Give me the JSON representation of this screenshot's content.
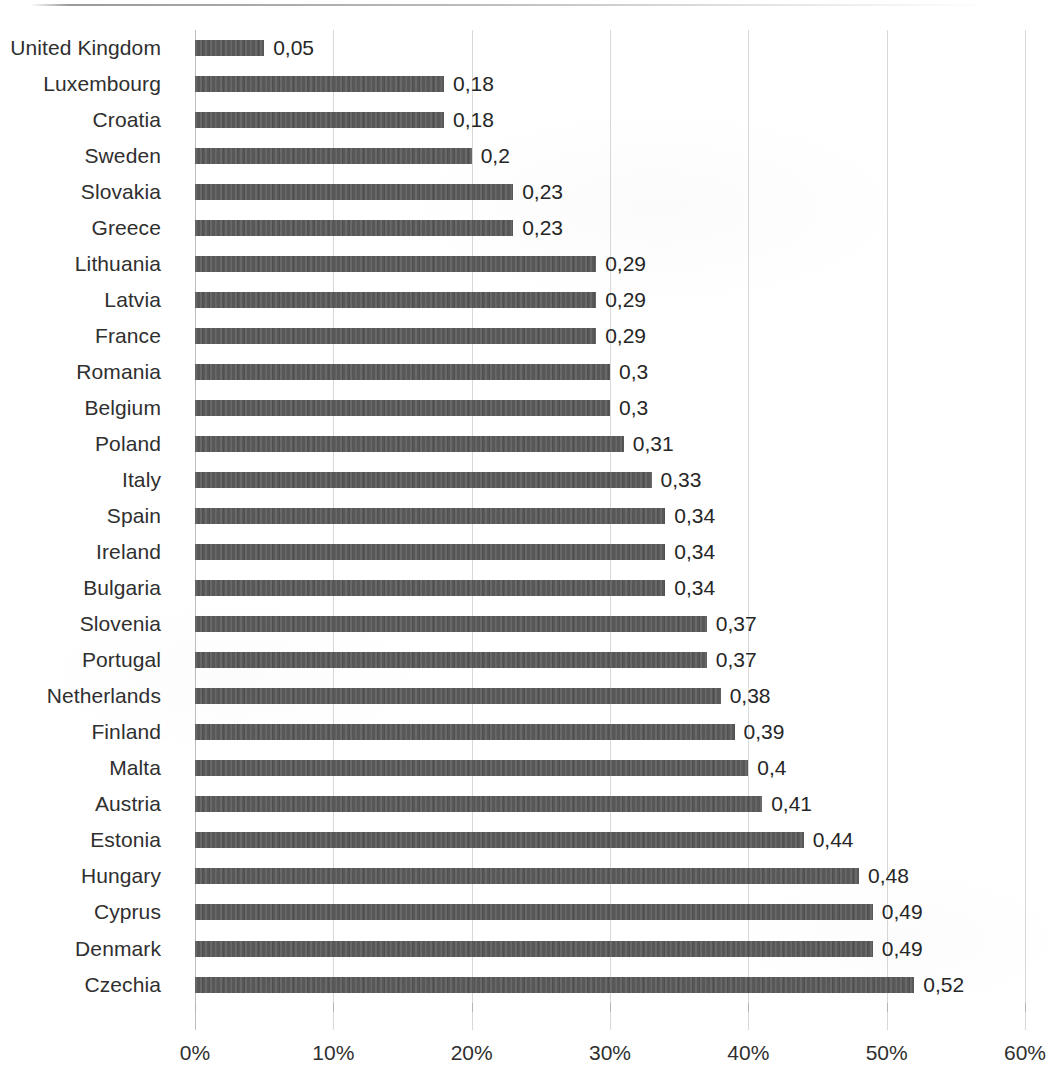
{
  "chart_data": {
    "type": "bar",
    "orientation": "horizontal",
    "title": "",
    "subtitle": "",
    "xlabel": "",
    "ylabel": "",
    "xlim": [
      0,
      0.6
    ],
    "x_tick_labels": [
      "0%",
      "10%",
      "20%",
      "30%",
      "40%",
      "50%",
      "60%"
    ],
    "x_tick_values": [
      0,
      0.1,
      0.2,
      0.3,
      0.4,
      0.5,
      0.6
    ],
    "grid": "vertical",
    "legend": "none",
    "bar_color": "#585858",
    "data_label_decimal_separator": ",",
    "categories": [
      "United Kingdom",
      "Luxembourg",
      "Croatia",
      "Sweden",
      "Slovakia",
      "Greece",
      "Lithuania",
      "Latvia",
      "France",
      "Romania",
      "Belgium",
      "Poland",
      "Italy",
      "Spain",
      "Ireland",
      "Bulgaria",
      "Slovenia",
      "Portugal",
      "Netherlands",
      "Finland",
      "Malta",
      "Austria",
      "Estonia",
      "Hungary",
      "Cyprus",
      "Denmark",
      "Czechia"
    ],
    "values": [
      0.05,
      0.18,
      0.18,
      0.2,
      0.23,
      0.23,
      0.29,
      0.29,
      0.29,
      0.3,
      0.3,
      0.31,
      0.33,
      0.34,
      0.34,
      0.34,
      0.37,
      0.37,
      0.38,
      0.39,
      0.4,
      0.41,
      0.44,
      0.48,
      0.49,
      0.49,
      0.52
    ],
    "data_labels": [
      "0,05",
      "0,18",
      "0,18",
      "0,2",
      "0,23",
      "0,23",
      "0,29",
      "0,29",
      "0,29",
      "0,3",
      "0,3",
      "0,31",
      "0,33",
      "0,34",
      "0,34",
      "0,34",
      "0,37",
      "0,37",
      "0,38",
      "0,39",
      "0,4",
      "0,41",
      "0,44",
      "0,48",
      "0,49",
      "0,49",
      "0,52"
    ]
  }
}
